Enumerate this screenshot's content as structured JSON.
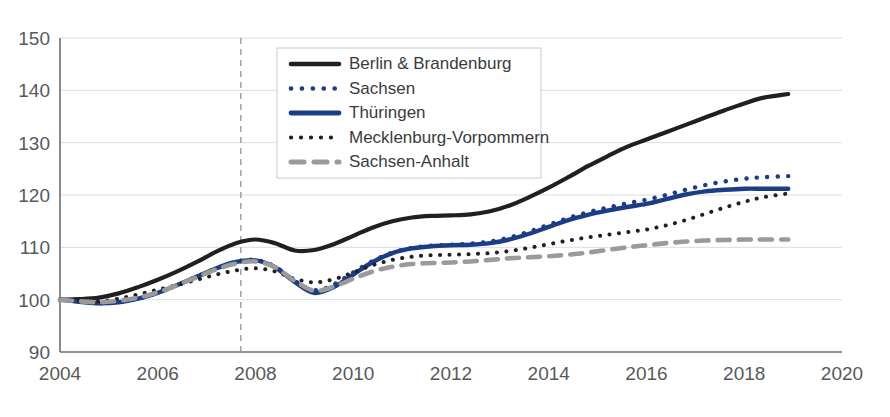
{
  "chart_data": {
    "type": "line",
    "title": "",
    "subtitle": "",
    "xlabel": "",
    "ylabel": "",
    "xlim": [
      2004,
      2020
    ],
    "ylim": [
      90,
      150
    ],
    "xticks": [
      "2004",
      "2006",
      "2008",
      "2010",
      "2012",
      "2014",
      "2016",
      "2018",
      "2020"
    ],
    "xtick_values": [
      2004,
      2006,
      2008,
      2010,
      2012,
      2014,
      2016,
      2018,
      2020
    ],
    "yticks": [
      "90",
      "100",
      "110",
      "120",
      "130",
      "140",
      "150"
    ],
    "ytick_values": [
      90,
      100,
      110,
      120,
      130,
      140,
      150
    ],
    "grid": "horizontal",
    "legend_position": "top-center",
    "annotations": [
      {
        "name": "reference-line",
        "type": "vline",
        "x": 2007.7,
        "style": "dashed",
        "color": "#9a9a9a"
      }
    ],
    "x": [
      2004,
      2004.4,
      2004.8,
      2005.2,
      2005.6,
      2006,
      2006.4,
      2006.8,
      2007.2,
      2007.6,
      2008,
      2008.4,
      2008.8,
      2009.2,
      2009.6,
      2010,
      2010.4,
      2010.8,
      2011.2,
      2011.6,
      2012,
      2012.4,
      2012.8,
      2013.2,
      2013.6,
      2014,
      2014.4,
      2014.8,
      2015.2,
      2015.6,
      2016,
      2016.4,
      2016.8,
      2017.2,
      2017.6,
      2018,
      2018.4,
      2018.9
    ],
    "series": [
      {
        "name": "Berlin & Brandenburg",
        "color": "#231f20",
        "style": "solid",
        "width": 4.2,
        "values": [
          100.0,
          100.1,
          100.4,
          101.2,
          102.4,
          103.8,
          105.4,
          107.2,
          109.2,
          110.8,
          111.5,
          110.8,
          109.4,
          109.5,
          110.6,
          112.2,
          113.8,
          115.0,
          115.7,
          116.0,
          116.1,
          116.3,
          116.9,
          118.0,
          119.6,
          121.4,
          123.4,
          125.5,
          127.4,
          129.2,
          130.6,
          132.0,
          133.4,
          134.8,
          136.2,
          137.5,
          138.6,
          139.3
        ]
      },
      {
        "name": "Sachsen",
        "color": "#1b3c86",
        "style": "dotted",
        "width": 4.4,
        "values": [
          100.0,
          99.6,
          99.3,
          99.5,
          100.2,
          101.3,
          102.8,
          104.4,
          106.0,
          107.2,
          107.6,
          106.3,
          103.6,
          101.8,
          102.9,
          105.2,
          107.4,
          109.0,
          109.9,
          110.3,
          110.5,
          110.7,
          111.1,
          111.9,
          113.0,
          114.3,
          115.6,
          116.7,
          117.6,
          118.4,
          119.1,
          120.0,
          121.0,
          121.9,
          122.6,
          123.1,
          123.4,
          123.6
        ]
      },
      {
        "name": "Thüringen",
        "color": "#1b3c86",
        "style": "solid",
        "width": 4.4,
        "values": [
          100.0,
          99.6,
          99.3,
          99.5,
          100.2,
          101.3,
          102.8,
          104.4,
          106.0,
          107.2,
          107.5,
          106.2,
          103.4,
          101.3,
          102.4,
          104.8,
          107.2,
          108.9,
          109.8,
          110.2,
          110.4,
          110.5,
          110.8,
          111.5,
          112.6,
          113.9,
          115.2,
          116.2,
          117.0,
          117.7,
          118.3,
          119.2,
          120.1,
          120.7,
          121.0,
          121.2,
          121.2,
          121.2
        ]
      },
      {
        "name": "Mecklenburg-Vorpommern",
        "color": "#231f20",
        "style": "dotted",
        "width": 4.0,
        "values": [
          100.0,
          99.8,
          99.7,
          100.2,
          101.0,
          101.9,
          102.8,
          103.8,
          104.8,
          105.6,
          106.0,
          105.4,
          104.0,
          103.3,
          103.9,
          105.2,
          106.6,
          107.6,
          108.2,
          108.5,
          108.6,
          108.7,
          108.9,
          109.3,
          109.9,
          110.6,
          111.3,
          111.9,
          112.4,
          112.9,
          113.4,
          114.2,
          115.2,
          116.4,
          117.6,
          118.7,
          119.6,
          120.3
        ]
      },
      {
        "name": "Sachsen-Anhalt",
        "color": "#9a9a9a",
        "style": "dashed",
        "width": 4.6,
        "values": [
          100.0,
          99.7,
          99.5,
          99.8,
          100.4,
          101.4,
          102.8,
          104.3,
          105.8,
          106.9,
          107.3,
          106.2,
          103.6,
          101.7,
          102.5,
          104.0,
          105.4,
          106.3,
          106.8,
          107.0,
          107.1,
          107.3,
          107.6,
          107.9,
          108.1,
          108.3,
          108.6,
          109.0,
          109.5,
          110.0,
          110.4,
          110.8,
          111.1,
          111.3,
          111.4,
          111.5,
          111.5,
          111.5
        ]
      }
    ]
  },
  "legend": {
    "items": [
      {
        "label": "Berlin & Brandenburg",
        "marker": "solid-line-black"
      },
      {
        "label": "Sachsen",
        "marker": "dotted-line-blue"
      },
      {
        "label": "Thüringen",
        "marker": "solid-line-blue"
      },
      {
        "label": "Mecklenburg-Vorpommern",
        "marker": "dotted-line-black"
      },
      {
        "label": "Sachsen-Anhalt",
        "marker": "dashed-line-gray"
      }
    ]
  },
  "colors": {
    "black": "#231f20",
    "blue": "#1b3c86",
    "gray": "#9a9a9a",
    "grid": "#d9dde2",
    "axis": "#6d6e71",
    "text": "#58595b",
    "legend_border": "#c9cbcd",
    "background": "#ffffff"
  }
}
